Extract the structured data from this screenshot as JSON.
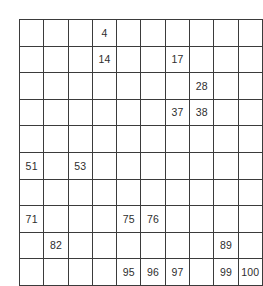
{
  "worksheet": {
    "type": "hundred-chart-fill-in-missing-numbers",
    "rows": 10,
    "columns": 10,
    "grid_line_color": "#3b3b3b",
    "text_color": "#2e2e2e",
    "background_color": "#ffffff"
  },
  "chart_data": {
    "type": "table",
    "title": "",
    "xlabel": "",
    "ylabel": "",
    "rows": 10,
    "columns": 10,
    "grid": true,
    "note": "Hundreds chart worksheet; blank cells are missing numbers to be filled in by the student. Values shown are the pre-printed numbers.",
    "cells": [
      [
        "",
        "",
        "",
        "4",
        "",
        "",
        "",
        "",
        "",
        ""
      ],
      [
        "",
        "",
        "",
        "14",
        "",
        "",
        "17",
        "",
        "",
        ""
      ],
      [
        "",
        "",
        "",
        "",
        "",
        "",
        "",
        "28",
        "",
        ""
      ],
      [
        "",
        "",
        "",
        "",
        "",
        "",
        "37",
        "38",
        "",
        ""
      ],
      [
        "",
        "",
        "",
        "",
        "",
        "",
        "",
        "",
        "",
        ""
      ],
      [
        "51",
        "",
        "53",
        "",
        "",
        "",
        "",
        "",
        "",
        ""
      ],
      [
        "",
        "",
        "",
        "",
        "",
        "",
        "",
        "",
        "",
        ""
      ],
      [
        "71",
        "",
        "",
        "",
        "75",
        "76",
        "",
        "",
        "",
        ""
      ],
      [
        "",
        "82",
        "",
        "",
        "",
        "",
        "",
        "",
        "89",
        ""
      ],
      [
        "",
        "",
        "",
        "",
        "95",
        "96",
        "97",
        "",
        "99",
        "100"
      ]
    ],
    "visible_values": [
      4,
      14,
      17,
      28,
      37,
      38,
      51,
      53,
      71,
      75,
      76,
      82,
      89,
      95,
      96,
      97,
      99,
      100
    ]
  }
}
